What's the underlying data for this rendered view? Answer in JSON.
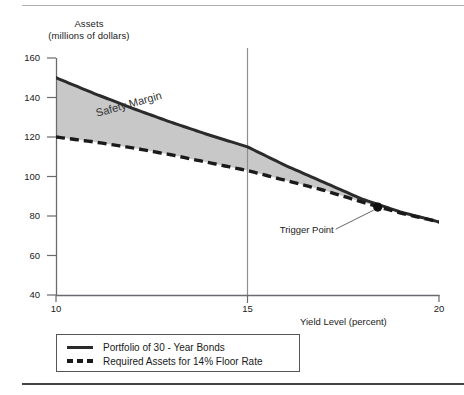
{
  "chart_data": {
    "type": "line",
    "title": "",
    "ylabel_line1": "Assets",
    "ylabel_line2": "(millions of dollars)",
    "xlabel": "Yield Level (percent)",
    "xlim": [
      10,
      20
    ],
    "ylim": [
      40,
      160
    ],
    "xticks": [
      "10",
      "15",
      "20"
    ],
    "yticks": [
      "160",
      "140",
      "120",
      "100",
      "80",
      "60",
      "40"
    ],
    "grid": false,
    "legend_position": "below-left",
    "series": [
      {
        "name": "Portfolio of 30 - Year Bonds",
        "style": "solid",
        "color": "#2b2b2b",
        "x": [
          10,
          11,
          12,
          13,
          14,
          15,
          16,
          17,
          18,
          19,
          20
        ],
        "values": [
          150.0,
          142.0,
          134.5,
          127.5,
          121.0,
          115.0,
          105.5,
          97.0,
          88.5,
          82.0,
          77.0
        ]
      },
      {
        "name": "Required Assets for 14% Floor Rate",
        "style": "dashed",
        "color": "#1a1a1a",
        "x": [
          10,
          11,
          12,
          13,
          14,
          15,
          16,
          17,
          18,
          19,
          20
        ],
        "values": [
          120.0,
          117.5,
          114.5,
          111.0,
          107.0,
          103.0,
          98.0,
          93.0,
          87.0,
          81.5,
          77.0
        ]
      }
    ],
    "shaded_region": {
      "label": "Safety Margin",
      "color": "#c8c8c8",
      "between": [
        "Portfolio of 30 - Year Bonds",
        "Required Assets for 14% Floor Rate"
      ]
    },
    "reference_line": {
      "axis": "x",
      "value": 15,
      "color": "#8d8d93"
    },
    "annotations": [
      {
        "label": "Trigger Point",
        "x": 18.4,
        "y": 84.5,
        "marker": "dot",
        "marker_color": "#111111"
      }
    ]
  },
  "legend": {
    "entries": [
      {
        "label": "Portfolio of 30 - Year Bonds"
      },
      {
        "label": "Required Assets for 14% Floor Rate"
      }
    ]
  }
}
